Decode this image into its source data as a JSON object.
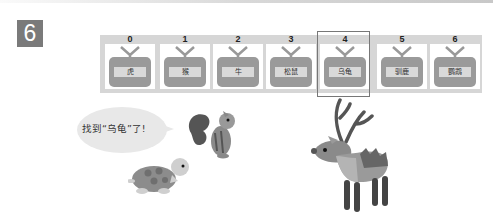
{
  "problem_number": "6",
  "array": {
    "indices": [
      "0",
      "1",
      "2",
      "3",
      "4",
      "5",
      "6"
    ],
    "labels": [
      "虎",
      "猴",
      "牛",
      "松鼠",
      "乌龟",
      "驯鹿",
      "鹦鹉"
    ],
    "selected_index": 4
  },
  "speech_bubble": {
    "text": "找到“乌龟”了!"
  },
  "characters": [
    "squirrel",
    "turtle",
    "reindeer"
  ],
  "colors": {
    "badge": "#7a7a7a",
    "strip": "#d6d6d6",
    "tv": "#9a9a9a",
    "highlight_border": "#777777"
  }
}
